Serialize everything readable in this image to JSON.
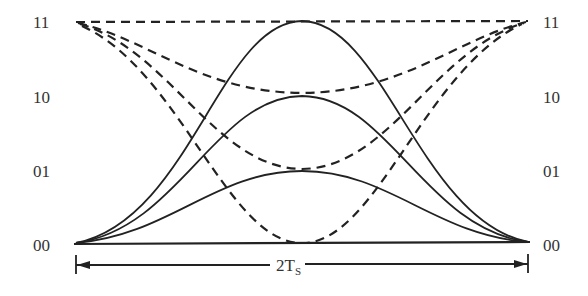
{
  "diagram": {
    "title": "",
    "levels": [
      "00",
      "01",
      "10",
      "11"
    ],
    "left_labels": [
      "11",
      "10",
      "01",
      "00"
    ],
    "right_labels": [
      "11",
      "10",
      "01",
      "00"
    ],
    "duration_label": "2T",
    "duration_subscript": "S",
    "solid_curves": [
      {
        "from": "00",
        "peak": "11",
        "to": "00"
      },
      {
        "from": "00",
        "peak": "10",
        "to": "00"
      },
      {
        "from": "00",
        "peak": "01",
        "to": "00"
      },
      {
        "from": "00",
        "peak": "00",
        "to": "00"
      }
    ],
    "dashed_curves": [
      {
        "from": "11",
        "trough": "11",
        "to": "11"
      },
      {
        "from": "11",
        "trough": "10",
        "to": "11"
      },
      {
        "from": "11",
        "trough": "01",
        "to": "11"
      },
      {
        "from": "11",
        "trough": "00",
        "to": "11"
      }
    ],
    "colors": {
      "line": "#222222",
      "text": "#333333",
      "background": "#ffffff"
    }
  }
}
